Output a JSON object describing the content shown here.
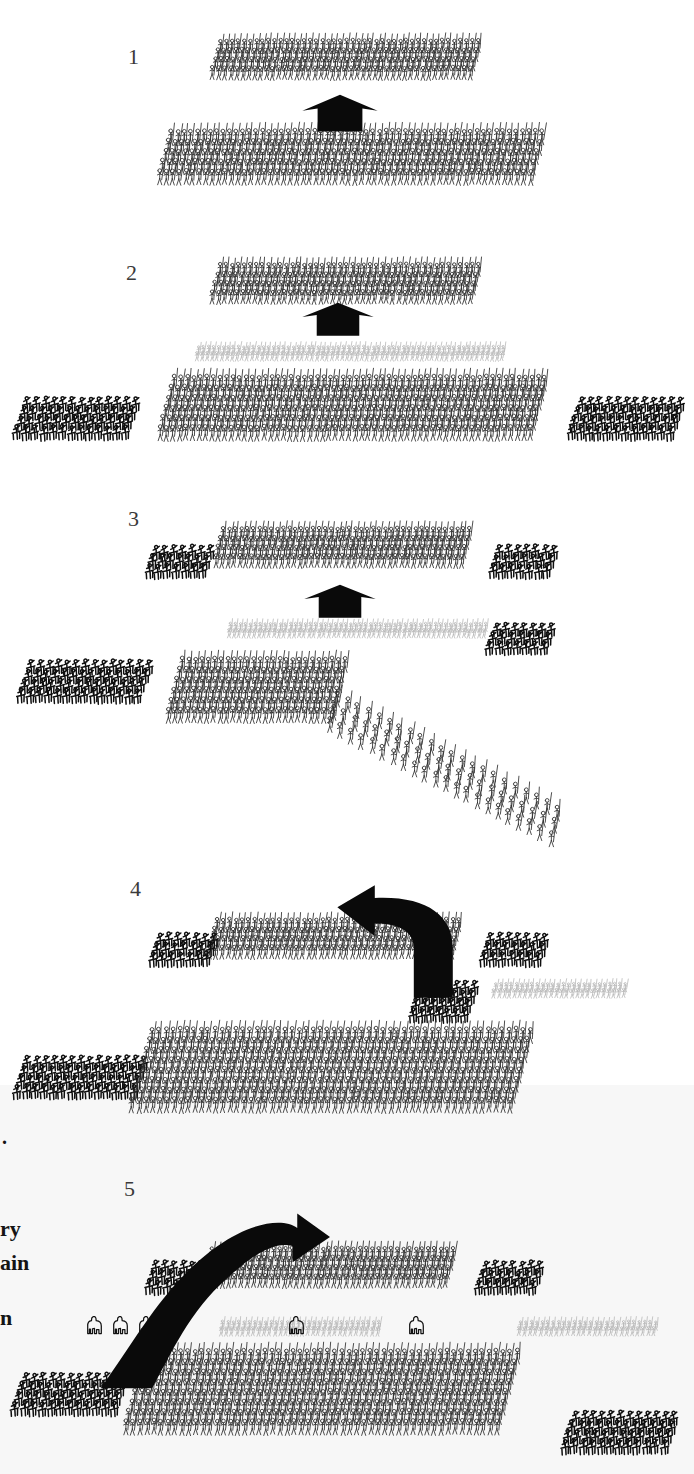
{
  "figure": {
    "kind": "battle-phase-diagram",
    "panel_count": 5,
    "width": 694,
    "height": 1474,
    "background_color": "#ffffff",
    "tint_color": "#f7f7f7",
    "ink_color": "#141414"
  },
  "panels": [
    {
      "id": "panel-1",
      "label": "1",
      "label_x": 128,
      "label_y": 46
    },
    {
      "id": "panel-2",
      "label": "2",
      "label_x": 126,
      "label_y": 262
    },
    {
      "id": "panel-3",
      "label": "3",
      "label_x": 128,
      "label_y": 508
    },
    {
      "id": "panel-4",
      "label": "4",
      "label_x": 130,
      "label_y": 878
    },
    {
      "id": "panel-5",
      "label": "5",
      "label_x": 124,
      "label_y": 1178
    }
  ],
  "page_tint": {
    "top": 1085,
    "height": 389
  },
  "margin_text": [
    {
      "text": ".",
      "x": 2,
      "y": 1126,
      "size": 20
    },
    {
      "text": "ry",
      "x": 0,
      "y": 1216,
      "size": 22
    },
    {
      "text": "ain",
      "x": 0,
      "y": 1250,
      "size": 22
    },
    {
      "text": "n",
      "x": 0,
      "y": 1305,
      "size": 22
    }
  ],
  "troop_types": {
    "heavy_infantry": {
      "name": "heavy-infantry",
      "color": "#2e2e2e",
      "weight": 0.85,
      "spear": true
    },
    "light_infantry": {
      "name": "light-infantry-skirmishers",
      "color": "#b9b9b9",
      "weight": 0.8,
      "spear": true
    },
    "cavalry": {
      "name": "cavalry",
      "color": "#0f0f0f",
      "weight": 1.5,
      "spear": false
    },
    "elephants": {
      "name": "war-elephants",
      "color": "#131313",
      "weight": 1.0,
      "spear": false
    }
  },
  "units": [
    {
      "id": "p1-top-infantry",
      "panel": 1,
      "type": "heavy_infantry",
      "x": 205,
      "y": 34,
      "cols": 44,
      "rows": 4,
      "cw": 6.0,
      "ch": 9.0,
      "skew": -16,
      "figw": 7.0,
      "figh": 15.0
    },
    {
      "id": "p1-bottom-infantry",
      "panel": 1,
      "type": "heavy_infantry",
      "x": 152,
      "y": 124,
      "cols": 58,
      "rows": 5,
      "cw": 6.5,
      "ch": 10.0,
      "skew": -16,
      "figw": 7.6,
      "figh": 17.0
    },
    {
      "id": "p2-top-infantry",
      "panel": 2,
      "type": "heavy_infantry",
      "x": 205,
      "y": 258,
      "cols": 44,
      "rows": 4,
      "cw": 6.0,
      "ch": 9.0,
      "skew": -16,
      "figw": 7.0,
      "figh": 15.0
    },
    {
      "id": "p2-skirmishers",
      "panel": 2,
      "type": "light_infantry",
      "x": 190,
      "y": 341,
      "cols": 62,
      "rows": 2,
      "cw": 5.0,
      "ch": 6.0,
      "skew": -16,
      "figw": 5.4,
      "figh": 10.0
    },
    {
      "id": "p2-left-cavalry",
      "panel": 2,
      "type": "cavalry",
      "x": 8,
      "y": 392,
      "cols": 13,
      "rows": 4,
      "cw": 9.0,
      "ch": 9.5,
      "skew": -20,
      "figw": 10.0,
      "figh": 16.0
    },
    {
      "id": "p2-main-infantry",
      "panel": 2,
      "type": "heavy_infantry",
      "x": 152,
      "y": 370,
      "cols": 58,
      "rows": 6,
      "cw": 6.5,
      "ch": 10.0,
      "skew": -16,
      "figw": 7.6,
      "figh": 17.0
    },
    {
      "id": "p2-right-cavalry",
      "panel": 2,
      "type": "cavalry",
      "x": 562,
      "y": 392,
      "cols": 12,
      "rows": 4,
      "cw": 9.0,
      "ch": 9.5,
      "skew": -20,
      "figw": 10.0,
      "figh": 16.0
    },
    {
      "id": "p3-top-infantry",
      "panel": 3,
      "type": "heavy_infantry",
      "x": 208,
      "y": 522,
      "cols": 42,
      "rows": 4,
      "cw": 6.0,
      "ch": 9.0,
      "skew": -16,
      "figw": 7.0,
      "figh": 15.0
    },
    {
      "id": "p3-topleft-cavalry",
      "panel": 3,
      "type": "cavalry",
      "x": 140,
      "y": 540,
      "cols": 7,
      "rows": 3,
      "cw": 9.0,
      "ch": 9.5,
      "skew": -20,
      "figw": 10.0,
      "figh": 16.0
    },
    {
      "id": "p3-topright-cavalry",
      "panel": 3,
      "type": "cavalry",
      "x": 484,
      "y": 540,
      "cols": 7,
      "rows": 3,
      "cw": 9.0,
      "ch": 9.5,
      "skew": -20,
      "figw": 10.0,
      "figh": 16.0
    },
    {
      "id": "p3-skirmishers",
      "panel": 3,
      "type": "light_infantry",
      "x": 222,
      "y": 618,
      "cols": 52,
      "rows": 2,
      "cw": 5.0,
      "ch": 6.0,
      "skew": -16,
      "figw": 5.4,
      "figh": 10.0
    },
    {
      "id": "p3-right-cavalry",
      "panel": 3,
      "type": "cavalry",
      "x": 481,
      "y": 618,
      "cols": 7,
      "rows": 3,
      "cw": 9.0,
      "ch": 9.0,
      "skew": -20,
      "figw": 10.0,
      "figh": 15.0
    },
    {
      "id": "p3-left-cavalry",
      "panel": 3,
      "type": "cavalry",
      "x": 12,
      "y": 655,
      "cols": 14,
      "rows": 4,
      "cw": 9.0,
      "ch": 9.5,
      "skew": -20,
      "figw": 10.0,
      "figh": 16.0
    },
    {
      "id": "p3-main-infantry",
      "panel": 3,
      "type": "heavy_infantry",
      "x": 160,
      "y": 652,
      "cols": 26,
      "rows": 6,
      "cw": 6.5,
      "ch": 10.0,
      "skew": -16,
      "figw": 7.6,
      "figh": 17.0
    },
    {
      "id": "p3-echelon",
      "panel": 3,
      "type": "heavy_infantry",
      "x": 322,
      "y": 686,
      "cols": 22,
      "rows": 3,
      "cw": 10.5,
      "ch": 13.0,
      "skew": -14,
      "figw": 8.0,
      "figh": 17.0,
      "stagger_y": 5.4
    },
    {
      "id": "p4-top-infantry",
      "panel": 4,
      "type": "heavy_infantry",
      "x": 202,
      "y": 913,
      "cols": 40,
      "rows": 4,
      "cw": 6.2,
      "ch": 9.0,
      "skew": -16,
      "figw": 7.0,
      "figh": 15.0
    },
    {
      "id": "p4-topleft-cavalry",
      "panel": 4,
      "type": "cavalry",
      "x": 144,
      "y": 928,
      "cols": 7,
      "rows": 3,
      "cw": 9.0,
      "ch": 9.5,
      "skew": -20,
      "figw": 10.0,
      "figh": 16.0
    },
    {
      "id": "p4-topright-cavalry",
      "panel": 4,
      "type": "cavalry",
      "x": 475,
      "y": 928,
      "cols": 7,
      "rows": 3,
      "cw": 9.0,
      "ch": 9.5,
      "skew": -20,
      "figw": 10.0,
      "figh": 16.0
    },
    {
      "id": "p4-pocket-cavalry",
      "panel": 4,
      "type": "cavalry",
      "x": 404,
      "y": 976,
      "cols": 7,
      "rows": 4,
      "cw": 8.5,
      "ch": 9.0,
      "skew": -20,
      "figw": 10.0,
      "figh": 16.0
    },
    {
      "id": "p4-skirmishers",
      "panel": 4,
      "type": "light_infantry",
      "x": 487,
      "y": 978,
      "cols": 26,
      "rows": 2,
      "cw": 5.2,
      "ch": 6.0,
      "skew": -16,
      "figw": 5.4,
      "figh": 10.0
    },
    {
      "id": "p4-left-cavalry",
      "panel": 4,
      "type": "cavalry",
      "x": 8,
      "y": 1051,
      "cols": 14,
      "rows": 4,
      "cw": 9.0,
      "ch": 9.5,
      "skew": -20,
      "figw": 10.0,
      "figh": 16.0
    },
    {
      "id": "p4-main-infantry",
      "panel": 4,
      "type": "heavy_infantry",
      "x": 124,
      "y": 1022,
      "cols": 55,
      "rows": 8,
      "cw": 7.0,
      "ch": 10.0,
      "skew": -16,
      "figw": 7.6,
      "figh": 17.0
    },
    {
      "id": "p5-top-infantry",
      "panel": 5,
      "type": "heavy_infantry",
      "x": 196,
      "y": 1242,
      "cols": 40,
      "rows": 4,
      "cw": 6.2,
      "ch": 9.0,
      "skew": -16,
      "figw": 7.0,
      "figh": 15.0
    },
    {
      "id": "p5-topleft-cavalry",
      "panel": 5,
      "type": "cavalry",
      "x": 140,
      "y": 1256,
      "cols": 7,
      "rows": 3,
      "cw": 9.0,
      "ch": 9.5,
      "skew": -20,
      "figw": 10.0,
      "figh": 16.0
    },
    {
      "id": "p5-topright-cavalry",
      "panel": 5,
      "type": "cavalry",
      "x": 470,
      "y": 1256,
      "cols": 7,
      "rows": 3,
      "cw": 9.0,
      "ch": 9.5,
      "skew": -20,
      "figw": 10.0,
      "figh": 16.0
    },
    {
      "id": "p5-elephants",
      "panel": 5,
      "type": "elephants",
      "x": 84,
      "y": 1312,
      "count": 4,
      "gap": 26,
      "figw": 17.0,
      "figh": 20.0
    },
    {
      "id": "p5-skirmishers",
      "panel": 5,
      "type": "light_infantry",
      "x": 214,
      "y": 1316,
      "cols": 30,
      "rows": 2,
      "cw": 5.4,
      "ch": 6.0,
      "skew": -16,
      "figw": 5.4,
      "figh": 10.0
    },
    {
      "id": "p5-elephants-mid",
      "panel": 5,
      "type": "elephants",
      "x": 286,
      "y": 1312,
      "count": 1,
      "gap": 26,
      "figw": 17.0,
      "figh": 20.0
    },
    {
      "id": "p5-elephants-mid2",
      "panel": 5,
      "type": "elephants",
      "x": 406,
      "y": 1312,
      "count": 1,
      "gap": 26,
      "figw": 17.0,
      "figh": 20.0
    },
    {
      "id": "p5-skirmishers-r",
      "panel": 5,
      "type": "light_infantry",
      "x": 512,
      "y": 1316,
      "cols": 26,
      "rows": 2,
      "cw": 5.4,
      "ch": 6.0,
      "skew": -16,
      "figw": 5.4,
      "figh": 10.0
    },
    {
      "id": "p5-left-cavalry",
      "panel": 5,
      "type": "cavalry",
      "x": 6,
      "y": 1368,
      "cols": 12,
      "rows": 4,
      "cw": 9.0,
      "ch": 9.5,
      "skew": -20,
      "figw": 10.0,
      "figh": 16.0
    },
    {
      "id": "p5-main-infantry",
      "panel": 5,
      "type": "heavy_infantry",
      "x": 118,
      "y": 1344,
      "cols": 54,
      "rows": 8,
      "cw": 7.0,
      "ch": 10.0,
      "skew": -16,
      "figw": 7.6,
      "figh": 17.0
    },
    {
      "id": "p5-right-cavalry",
      "panel": 5,
      "type": "cavalry",
      "x": 556,
      "y": 1406,
      "cols": 12,
      "rows": 4,
      "cw": 9.0,
      "ch": 9.5,
      "skew": -20,
      "figw": 10.0,
      "figh": 16.0
    }
  ],
  "arrows": [
    {
      "id": "p1-advance-arrow",
      "panel": 1,
      "shape": "chevron-up",
      "x": 300,
      "y": 94,
      "w": 80,
      "h": 38,
      "name": "advance-arrow"
    },
    {
      "id": "p2-advance-arrow",
      "panel": 2,
      "shape": "chevron-up",
      "x": 300,
      "y": 302,
      "w": 76,
      "h": 34,
      "name": "advance-arrow"
    },
    {
      "id": "p3-advance-arrow",
      "panel": 3,
      "shape": "chevron-up",
      "x": 302,
      "y": 584,
      "w": 76,
      "h": 34,
      "name": "advance-arrow"
    },
    {
      "id": "p4-flank-arrow",
      "panel": 4,
      "shape": "hook-left",
      "x": 328,
      "y": 884,
      "w": 156,
      "h": 116,
      "name": "cavalry-flanking-arrow"
    },
    {
      "id": "p5-flank-arrow",
      "panel": 5,
      "shape": "sweep-right",
      "x": 96,
      "y": 1210,
      "w": 234,
      "h": 180,
      "name": "cavalry-sweep-arrow"
    }
  ]
}
